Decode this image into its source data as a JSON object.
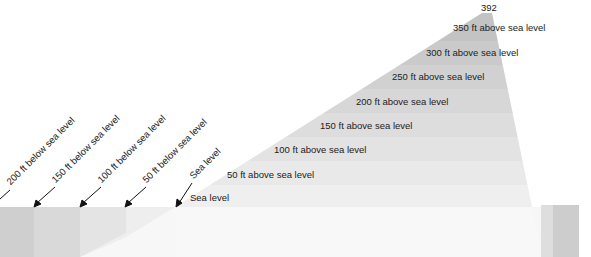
{
  "diagram": {
    "peak_label": "392",
    "above_labels": [
      {
        "text": "350 ft above sea level",
        "x": 453,
        "y": 29
      },
      {
        "text": "300 ft above sea level",
        "x": 426,
        "y": 54
      },
      {
        "text": "250 ft above sea level",
        "x": 392,
        "y": 78
      },
      {
        "text": "200 ft above sea level",
        "x": 356,
        "y": 102
      },
      {
        "text": "150 ft above sea level",
        "x": 320,
        "y": 126
      },
      {
        "text": "100 ft above sea level",
        "x": 274,
        "y": 150
      },
      {
        "text": "50 ft above sea level",
        "x": 227,
        "y": 175
      },
      {
        "text": "Sea level",
        "x": 190,
        "y": 198
      }
    ],
    "below_labels": [
      {
        "text": "200 ft below sea level",
        "x": 14,
        "y": 182
      },
      {
        "text": "150 ft below sea level",
        "x": 59,
        "y": 180
      },
      {
        "text": "100 ft below sea level",
        "x": 105,
        "y": 180
      },
      {
        "text": "50 ft below sea level",
        "x": 150,
        "y": 180
      },
      {
        "text": "Sea level",
        "x": 196,
        "y": 176
      }
    ],
    "colors": {
      "block_200": "#cfcfcf",
      "block_150": "#d8d8d8",
      "block_100": "#e3e3e3",
      "block_50": "#eeeeee",
      "sea_base": "#f7f7f7",
      "band_0": "#eeeeee",
      "band_50": "#e8e8e8",
      "band_100": "#e2e2e2",
      "band_150": "#dcdcdc",
      "band_200": "#d6d6d6",
      "band_250": "#d0d0d0",
      "band_300": "#c9c9c9",
      "band_350": "#c2c2c2",
      "right_block": "#cccccc"
    }
  }
}
